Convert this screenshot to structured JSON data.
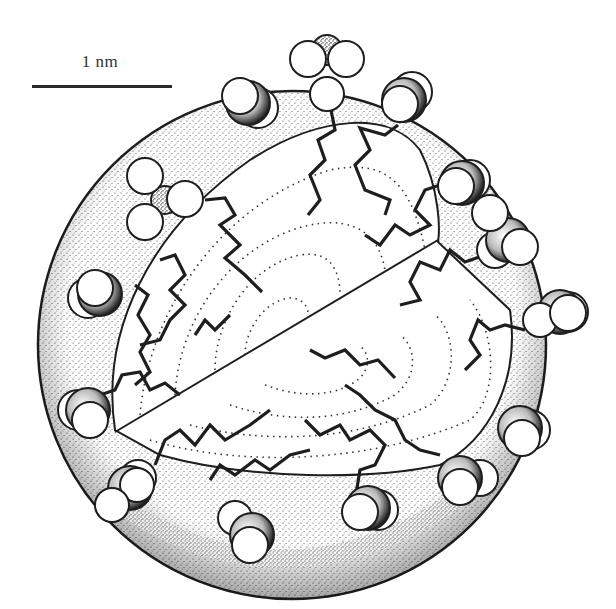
{
  "figure": {
    "type": "micelle-cross-section-diagram",
    "colors": {
      "ink": "#1e1e1e",
      "background": "#ffffff",
      "stipple": "#3a3a3a"
    }
  },
  "scale_bar": {
    "label": "1 nm",
    "length_px": 140
  },
  "micelle": {
    "center": [
      292,
      345
    ],
    "radius": 255,
    "head_groups": [
      {
        "x": 327,
        "y": 62,
        "type": "trigonal"
      },
      {
        "x": 404,
        "y": 98,
        "type": "side"
      },
      {
        "x": 246,
        "y": 100,
        "type": "side"
      },
      {
        "x": 156,
        "y": 197,
        "type": "trigonal"
      },
      {
        "x": 460,
        "y": 183,
        "type": "side"
      },
      {
        "x": 508,
        "y": 233,
        "type": "side"
      },
      {
        "x": 556,
        "y": 312,
        "type": "side"
      },
      {
        "x": 95,
        "y": 293,
        "type": "side"
      },
      {
        "x": 85,
        "y": 410,
        "type": "side"
      },
      {
        "x": 520,
        "y": 430,
        "type": "side"
      },
      {
        "x": 455,
        "y": 478,
        "type": "side"
      },
      {
        "x": 128,
        "y": 490,
        "type": "side"
      },
      {
        "x": 365,
        "y": 508,
        "type": "side"
      },
      {
        "x": 245,
        "y": 535,
        "type": "side"
      }
    ]
  }
}
